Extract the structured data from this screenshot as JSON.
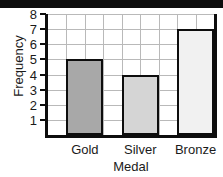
{
  "chart_data": {
    "type": "bar",
    "title": "",
    "subtitle": "",
    "xlabel": "Medal",
    "ylabel": "Frequency",
    "categories": [
      "Gold",
      "Silver",
      "Bronze"
    ],
    "values": [
      5,
      4,
      7
    ],
    "series": [
      {
        "name": "Frequency",
        "values": [
          5,
          4,
          7
        ]
      }
    ],
    "ylim": [
      0,
      8
    ],
    "ytick_labels": [
      "1",
      "2",
      "3",
      "4",
      "5",
      "6",
      "7",
      "8"
    ],
    "ytick_values": [
      1,
      2,
      3,
      4,
      5,
      6,
      7,
      8
    ],
    "grid": true,
    "grid_vertical_columns": 9,
    "legend": "none",
    "bar_colors": [
      "#a8a8a8",
      "#d5d5d5",
      "#f1f1f1"
    ],
    "bar_edge_color": "#0d0d0d",
    "grid_color": "#b9b9b9",
    "axis_color": "#0d0d0d",
    "background_color": "#ffffff"
  },
  "figure": {
    "top_band_color": "#0d0d0d"
  }
}
